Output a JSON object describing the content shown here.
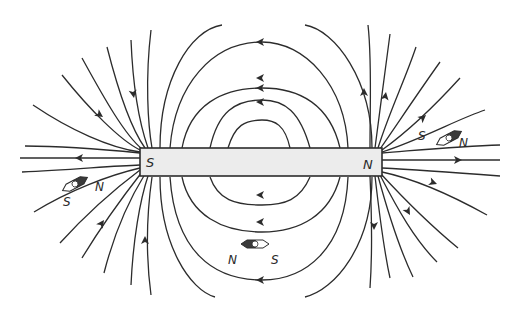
{
  "diagram": {
    "magnet": {
      "left_pole_label": "S",
      "right_pole_label": "N",
      "fill_color": "#ececec",
      "outline_color": "#2c2c2c"
    },
    "compasses": [
      {
        "position": "lower-left near S pole",
        "north_label": "N",
        "south_label": "S"
      },
      {
        "position": "upper-right near N pole",
        "north_label": "N",
        "south_label": "S"
      },
      {
        "position": "below magnet center",
        "north_label": "N",
        "south_label": "S"
      }
    ],
    "field_direction": "from N pole outward, looping around, into S pole",
    "line_color": "#2c2c2c",
    "background_color": "#ffffff"
  }
}
